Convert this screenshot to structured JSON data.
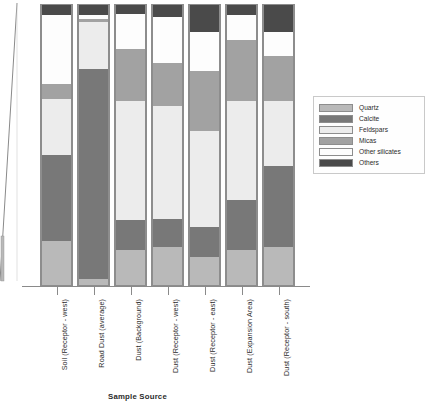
{
  "chart": {
    "xlabel": "Sample Source",
    "ylabel": ""
  },
  "legend": {
    "title": "",
    "position": "right"
  },
  "chart_data": {
    "type": "bar",
    "subtype": "stacked-100-percent",
    "title": "",
    "xlabel": "Sample Source",
    "ylabel": "",
    "ylim": [
      0,
      100
    ],
    "grid": false,
    "legend_position": "right",
    "categories": [
      "Soil (Receptor - west)",
      "Road Dust (average)",
      "Dust (Background)",
      "Dust (Receptor - west)",
      "Dust (Receptor - east)",
      "Dust (Expansion Area)",
      "Dust (Receptor - south)"
    ],
    "series": [
      {
        "name": "Quartz",
        "color": "#b9b9b9",
        "values": [
          15.2,
          2.1,
          12.4,
          13.5,
          10.0,
          12.4,
          13.5
        ]
      },
      {
        "name": "Calcite",
        "color": "#787878",
        "values": [
          30.1,
          73.8,
          10.6,
          9.6,
          10.6,
          17.7,
          28.4
        ]
      },
      {
        "name": "Feldspars",
        "color": "#ececec",
        "values": [
          19.5,
          16.3,
          41.8,
          40.1,
          33.7,
          34.8,
          23.0
        ]
      },
      {
        "name": "Micas",
        "color": "#a2a2a2",
        "values": [
          5.3,
          1.1,
          18.4,
          15.2,
          21.3,
          21.3,
          16.0
        ]
      },
      {
        "name": "Other silicates",
        "color": "#fdfdfd",
        "values": [
          23.8,
          1.4,
          12.1,
          16.0,
          13.5,
          8.9,
          8.2
        ]
      },
      {
        "name": "Others",
        "color": "#4a4a4a",
        "values": [
          3.5,
          3.5,
          3.2,
          4.3,
          9.6,
          3.5,
          9.6
        ]
      }
    ]
  }
}
